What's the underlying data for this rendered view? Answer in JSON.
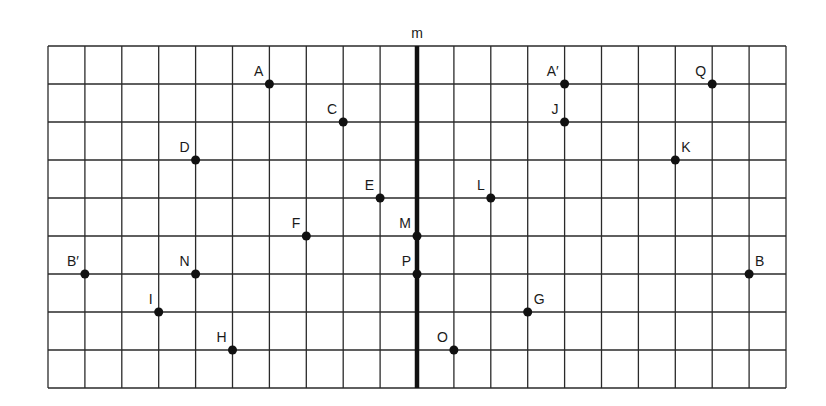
{
  "diagram": {
    "type": "reflection-grid",
    "mirror_line_label": "m",
    "grid": {
      "columns": 20,
      "rows": 9,
      "origin_px": [
        48,
        46
      ],
      "cell_w": 36.9,
      "cell_h": 38,
      "line_color": "#2a2a2a",
      "mirror_column": 10,
      "mirror_color": "#111111"
    },
    "points": [
      {
        "name": "A",
        "col": 6,
        "row": 1,
        "label_pos": "upper-left"
      },
      {
        "name": "C",
        "col": 8,
        "row": 2,
        "label_pos": "upper-left"
      },
      {
        "name": "D",
        "col": 4,
        "row": 3,
        "label_pos": "upper-left"
      },
      {
        "name": "E",
        "col": 9,
        "row": 4,
        "label_pos": "upper-left"
      },
      {
        "name": "F",
        "col": 7,
        "row": 5,
        "label_pos": "upper-left"
      },
      {
        "name": "M",
        "col": 10,
        "row": 5,
        "label_pos": "upper-left"
      },
      {
        "name": "P",
        "col": 10,
        "row": 6,
        "label_pos": "upper-left"
      },
      {
        "name": "B′",
        "col": 1,
        "row": 6,
        "label_pos": "upper-left"
      },
      {
        "name": "N",
        "col": 4,
        "row": 6,
        "label_pos": "upper-left"
      },
      {
        "name": "I",
        "col": 3,
        "row": 7,
        "label_pos": "upper-left"
      },
      {
        "name": "H",
        "col": 5,
        "row": 8,
        "label_pos": "upper-left"
      },
      {
        "name": "A′",
        "col": 14,
        "row": 1,
        "label_pos": "upper-left"
      },
      {
        "name": "Q",
        "col": 18,
        "row": 1,
        "label_pos": "upper-left"
      },
      {
        "name": "J",
        "col": 14,
        "row": 2,
        "label_pos": "upper-left"
      },
      {
        "name": "K",
        "col": 17,
        "row": 3,
        "label_pos": "upper-right"
      },
      {
        "name": "L",
        "col": 12,
        "row": 4,
        "label_pos": "upper-left"
      },
      {
        "name": "B",
        "col": 19,
        "row": 6,
        "label_pos": "upper-right"
      },
      {
        "name": "G",
        "col": 13,
        "row": 7,
        "label_pos": "upper-right"
      },
      {
        "name": "O",
        "col": 11,
        "row": 8,
        "label_pos": "upper-left"
      }
    ]
  }
}
